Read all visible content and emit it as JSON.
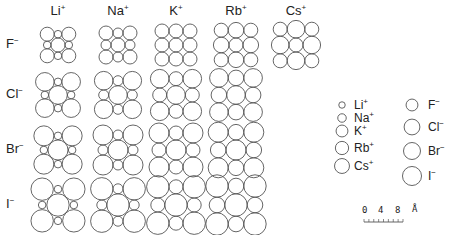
{
  "diagram": {
    "columns": [
      {
        "ion": "Li",
        "charge": "+"
      },
      {
        "ion": "Na",
        "charge": "+"
      },
      {
        "ion": "K",
        "charge": "+"
      },
      {
        "ion": "Rb",
        "charge": "+"
      },
      {
        "ion": "Cs",
        "charge": "+"
      }
    ],
    "rows": [
      {
        "ion": "F",
        "charge": "−"
      },
      {
        "ion": "Cl",
        "charge": "−"
      },
      {
        "ion": "Br",
        "charge": "−"
      },
      {
        "ion": "I",
        "charge": "−"
      }
    ],
    "radii": {
      "cations": {
        "Li": 3.8,
        "Na": 5.0,
        "K": 7.0,
        "Rb": 7.8,
        "Cs": 8.8
      },
      "anions": {
        "F": 7.0,
        "Cl": 9.3,
        "Br": 10.0,
        "I": 11.2
      }
    },
    "legend": {
      "cations": [
        {
          "ion": "Li",
          "charge": "+"
        },
        {
          "ion": "Na",
          "charge": "+"
        },
        {
          "ion": "K",
          "charge": "+"
        },
        {
          "ion": "Rb",
          "charge": "+"
        },
        {
          "ion": "Cs",
          "charge": "+"
        }
      ],
      "anions": [
        {
          "ion": "F",
          "charge": "−"
        },
        {
          "ion": "Cl",
          "charge": "−"
        },
        {
          "ion": "Br",
          "charge": "−"
        },
        {
          "ion": "I",
          "charge": "−"
        }
      ]
    },
    "scale_bar": {
      "ticks": [
        "0",
        "4",
        "8"
      ],
      "unit": "Å"
    }
  }
}
